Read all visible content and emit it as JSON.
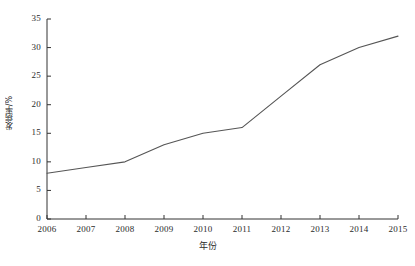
{
  "chart_data": {
    "type": "line",
    "title": "",
    "subtitle": "",
    "xlabel": "年份",
    "ylabel": "发病率/%",
    "categories": [
      "2006",
      "2007",
      "2008",
      "2009",
      "2010",
      "2011",
      "2012",
      "2013",
      "2014",
      "2015"
    ],
    "x": [
      2006,
      2007,
      2008,
      2009,
      2010,
      2011,
      2012,
      2013,
      2014,
      2015
    ],
    "values": [
      8,
      9,
      10,
      13,
      15,
      16,
      21.5,
      27,
      30,
      32
    ],
    "series": [
      {
        "name": "发病率",
        "values": [
          8,
          9,
          10,
          13,
          15,
          16,
          21.5,
          27,
          30,
          32
        ]
      }
    ],
    "xlim": [
      2006,
      2015
    ],
    "ylim": [
      0,
      35
    ],
    "yticks": [
      0,
      5,
      10,
      15,
      20,
      25,
      30,
      35
    ],
    "ytick_labels": [
      "0",
      "5",
      "10",
      "15",
      "20",
      "25",
      "30",
      "35"
    ],
    "xtick_labels": [
      "2006",
      "2007",
      "2008",
      "2009",
      "2010",
      "2011",
      "2012",
      "2013",
      "2014",
      "2015"
    ],
    "grid": false,
    "legend": false,
    "legend_position": "none",
    "markers": false,
    "line_color": "#555555",
    "axis_color": "#333333",
    "background_color": "#ffffff"
  }
}
